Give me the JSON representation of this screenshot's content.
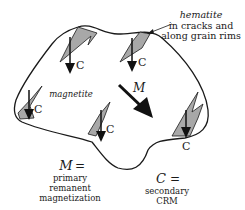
{
  "diagram": {
    "type": "mineral grain schematic",
    "colors": {
      "outline": "#1a1a1a",
      "hematite_fill": "#a8a8a8",
      "arrow": "#111111",
      "background": "#ffffff"
    },
    "labels": {
      "hematite_title": "hematite",
      "hematite_line1": "in cracks and",
      "hematite_line2": "along grain rims",
      "magnetite": "magnetite",
      "M_arrow": "M",
      "C_arrow": "C"
    },
    "legend": {
      "M": {
        "symbol": "M",
        "equals": "=",
        "line1": "primary",
        "line2": "remanent",
        "line3": "magnetization"
      },
      "C": {
        "symbol": "C",
        "equals": "=",
        "line1": "secondary",
        "line2": "CRM"
      }
    },
    "c_arrow_count": 5
  }
}
